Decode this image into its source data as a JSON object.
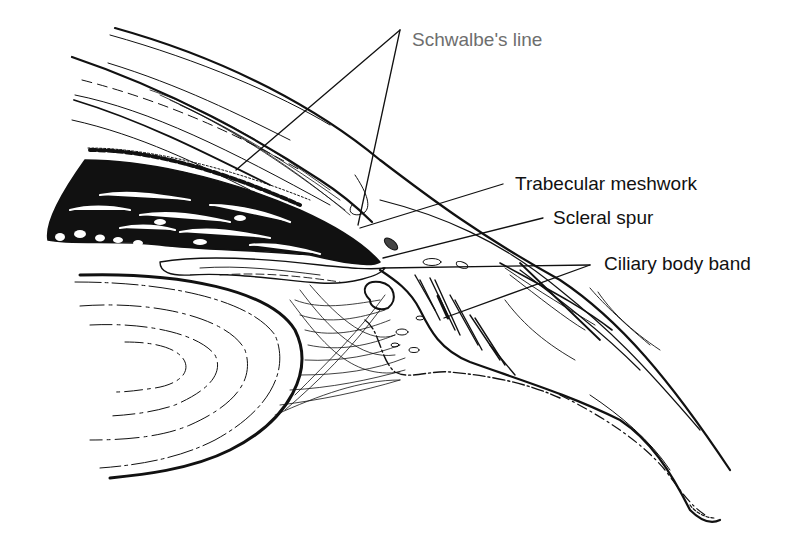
{
  "diagram": {
    "labels": [
      {
        "id": "schwalbes-line",
        "text": "Schwalbe's line",
        "x": 412,
        "y": 48,
        "color": "#6e6e6e",
        "leaders": [
          {
            "from": [
              400,
              30
            ],
            "to": [
              236,
              170
            ]
          },
          {
            "from": [
              400,
              30
            ],
            "to": [
              358,
              225
            ]
          }
        ]
      },
      {
        "id": "trabecular-meshwork",
        "text": "Trabecular meshwork",
        "x": 515,
        "y": 172,
        "color": "#111111",
        "leaders": [
          {
            "from": [
              503,
              184
            ],
            "to": [
              360,
              228
            ]
          }
        ]
      },
      {
        "id": "scleral-spur",
        "text": "Scleral spur",
        "x": 553,
        "y": 206,
        "color": "#111111",
        "leaders": [
          {
            "from": [
              543,
              218
            ],
            "to": [
              383,
              258
            ]
          }
        ]
      },
      {
        "id": "ciliary-body-band",
        "text": "Ciliary body band",
        "x": 604,
        "y": 253,
        "color": "#111111",
        "leaders": [
          {
            "from": [
              590,
              265
            ],
            "to": [
              383,
              268
            ]
          },
          {
            "from": [
              590,
              265
            ],
            "to": [
              444,
              318
            ]
          }
        ]
      }
    ],
    "structures": [
      "cornea",
      "sclera",
      "iris",
      "lens",
      "zonular fibers",
      "ciliary body",
      "trabecular meshwork"
    ]
  }
}
